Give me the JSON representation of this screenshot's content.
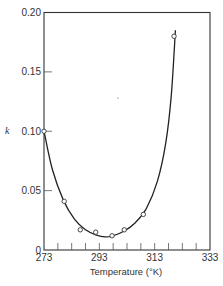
{
  "chart_data": {
    "type": "line",
    "title": "",
    "xlabel": "Temperature (°K)",
    "ylabel": "k",
    "xlim": [
      273,
      333
    ],
    "ylim": [
      0,
      0.2
    ],
    "x_ticks": [
      "273",
      "293",
      "313",
      "333"
    ],
    "y_ticks": [
      "0",
      "0.05",
      "0.10",
      "0.15",
      "0.20"
    ],
    "x_minor_tick_step": 5,
    "grid": false,
    "legend": null,
    "series": [
      {
        "name": "measured",
        "style": "open-circle markers",
        "x": [
          273,
          280.3,
          286.1,
          291.7,
          297.6,
          302.0,
          308.9,
          320.0
        ],
        "y": [
          0.1,
          0.041,
          0.017,
          0.015,
          0.012,
          0.017,
          0.03,
          0.18
        ]
      },
      {
        "name": "fitted curve",
        "style": "solid line",
        "x": [
          273,
          276,
          280,
          284,
          288,
          292,
          295,
          298,
          302,
          306,
          310,
          314,
          317,
          319,
          320.5
        ],
        "y": [
          0.1,
          0.068,
          0.042,
          0.026,
          0.017,
          0.0125,
          0.011,
          0.012,
          0.016,
          0.023,
          0.035,
          0.058,
          0.09,
          0.13,
          0.185
        ]
      }
    ]
  },
  "axes": {
    "x_title": "Temperature (°K)",
    "y_title": "k",
    "x_labels": [
      "273",
      "293",
      "313",
      "333"
    ],
    "y_labels": [
      "0",
      "0.05",
      "0.10",
      "0.15",
      "0.20"
    ]
  }
}
